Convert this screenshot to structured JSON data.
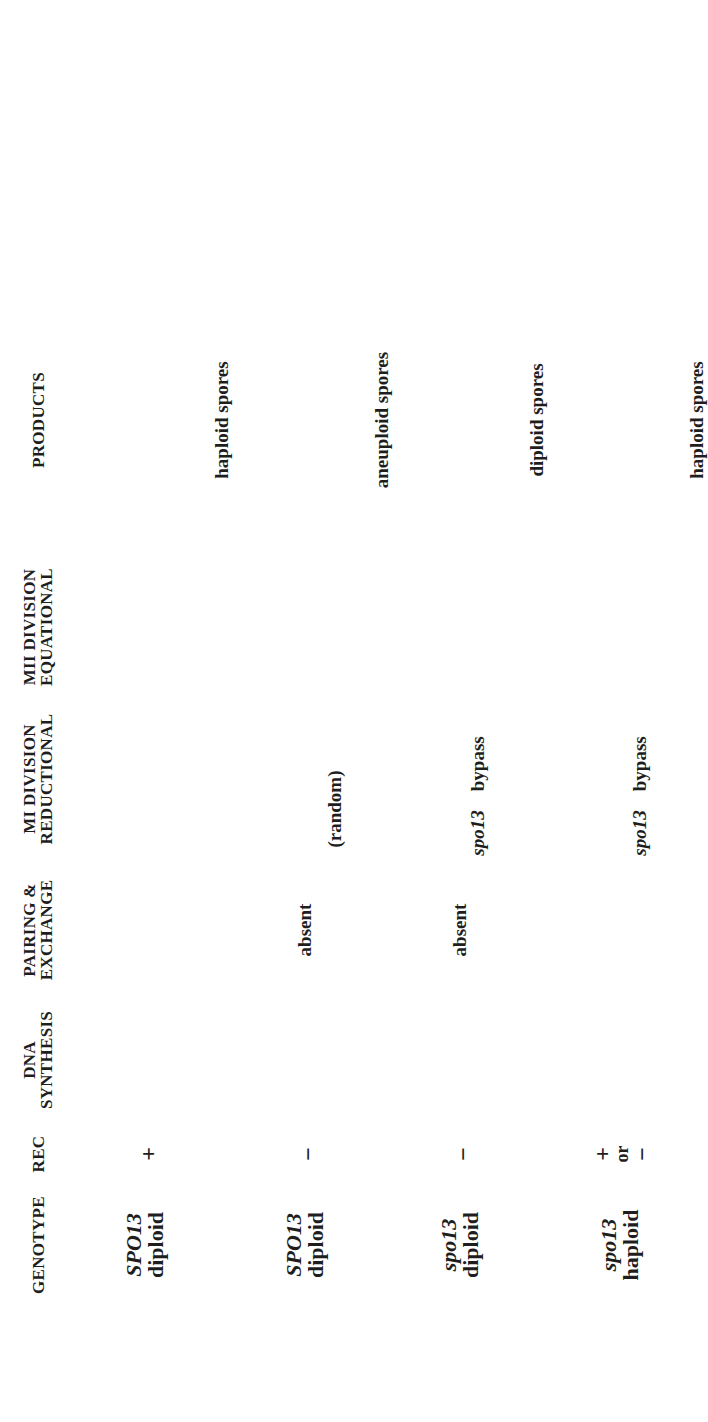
{
  "figure": {
    "orientation": "rotated 90 degrees counter-clockwise",
    "columns": [
      {
        "id": "genotype",
        "lines": [
          "GENOTYPE"
        ]
      },
      {
        "id": "rec",
        "lines": [
          "REC"
        ]
      },
      {
        "id": "dna",
        "lines": [
          "DNA",
          "SYNTHESIS"
        ]
      },
      {
        "id": "pairing",
        "lines": [
          "PAIRING &",
          "EXCHANGE"
        ]
      },
      {
        "id": "mi",
        "lines": [
          "MI  DIVISION",
          "REDUCTIONAL"
        ]
      },
      {
        "id": "mii",
        "lines": [
          "MII  DIVISION",
          "EQUATIONAL"
        ]
      },
      {
        "id": "products",
        "lines": [
          "PRODUCTS"
        ]
      }
    ],
    "rows": [
      {
        "genotype_gene": "SPO13",
        "genotype_ploidy": "diploid",
        "rec": "+",
        "dna_synthesis": "two chromosome pairs: + + and − −",
        "pairing": "crossover between homologs (+ + / − −)",
        "mi": "homologs segregate to opposite poles (+ − / + −)",
        "mii": "sister chromatids separate (+ − , + −)",
        "products_label": "haploid spores",
        "products_count": 4
      },
      {
        "genotype_gene": "SPO13",
        "genotype_ploidy": "diploid",
        "rec": "−",
        "dna_synthesis": "two chromosome pairs: + + and − −",
        "pairing": "absent",
        "mi": "random segregation",
        "mi_note": "(random)",
        "mii": "sister chromatids separate (+ + , − −)",
        "products_label": "aneuploid spores",
        "products_count": 4
      },
      {
        "genotype_gene": "spo13",
        "genotype_ploidy": "diploid",
        "rec": "−",
        "dna_synthesis": "two chromosome pairs: + + and − −",
        "pairing": "absent",
        "mi": "spo13 bypass",
        "mi_gene": "spo13",
        "mi_word": "bypass",
        "mii": "sister chromatids separate (+ + , − −)",
        "products_label": "diploid spores",
        "products_count": 2
      },
      {
        "genotype_gene": "spo13",
        "genotype_ploidy": "haploid",
        "rec": "+",
        "rec_or": "or",
        "rec_alt": "−",
        "dna_synthesis": "one chromosome: + +",
        "pairing": "single chromosome (+ +)",
        "mi": "spo13 bypass",
        "mi_gene": "spo13",
        "mi_word": "bypass",
        "mii": "sister chromatids separate (+ +)",
        "products_label": "haploid spores",
        "products_count": 2
      }
    ]
  },
  "colors": {
    "ink": "#1e1e1e",
    "background": "#ffffff"
  }
}
